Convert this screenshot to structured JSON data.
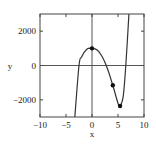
{
  "chart_data": {
    "type": "line",
    "title": "",
    "xlabel": "x",
    "ylabel": "y",
    "xlim": [
      -10,
      10
    ],
    "ylim": [
      -3000,
      3000
    ],
    "xticks": [
      -10,
      -5,
      0,
      5,
      10
    ],
    "yticks": [
      -2000,
      0,
      2000
    ],
    "xtick_labels": [
      "−10",
      "−5",
      "0",
      "5",
      "10"
    ],
    "ytick_labels": [
      "−2000",
      "0",
      "2000"
    ],
    "grid": false,
    "series": [
      {
        "name": "curve",
        "x": [
          -3.3,
          -2.5,
          -2,
          -1,
          0,
          1,
          2,
          3,
          4,
          5,
          5.4,
          6,
          6.5,
          7.1
        ],
        "y": [
          -3000,
          0,
          500,
          950,
          1000,
          900,
          500,
          -200,
          -1150,
          -2200,
          -2360,
          -1800,
          0,
          3000
        ]
      }
    ],
    "points": [
      {
        "x": 0,
        "y": 1000
      },
      {
        "x": 4,
        "y": -1150
      },
      {
        "x": 5.4,
        "y": -2360
      }
    ]
  }
}
